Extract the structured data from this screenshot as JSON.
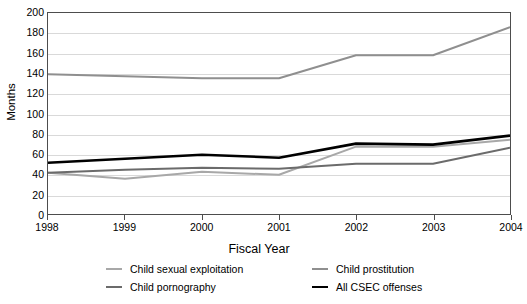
{
  "chart_data": {
    "type": "line",
    "title": "",
    "xlabel": "Fiscal Year",
    "ylabel": "Months",
    "x": [
      1998,
      1999,
      2000,
      2001,
      2002,
      2003,
      2004
    ],
    "categories": [
      "1998",
      "1999",
      "2000",
      "2001",
      "2002",
      "2003",
      "2004"
    ],
    "ylim": [
      0,
      200
    ],
    "yticks": [
      0,
      20,
      40,
      60,
      80,
      100,
      120,
      140,
      160,
      180,
      200
    ],
    "ytick_labels": [
      "0",
      "20",
      "40",
      "60",
      "80",
      "100",
      "120",
      "140",
      "160",
      "180",
      "200"
    ],
    "grid": true,
    "legend_position": "bottom",
    "series": [
      {
        "name": "Child sexual exploitation",
        "color": "#a8a8a8",
        "width": 2,
        "values": [
          41,
          35,
          42,
          39,
          67,
          67,
          74
        ]
      },
      {
        "name": "Child pornography",
        "color": "#6b6b6b",
        "width": 2,
        "values": [
          41,
          44,
          46,
          45,
          50,
          50,
          66
        ]
      },
      {
        "name": "Child prostitution",
        "color": "#8f8f8f",
        "width": 2,
        "values": [
          139,
          137,
          135,
          135,
          158,
          158,
          186
        ]
      },
      {
        "name": "All CSEC offenses",
        "color": "#000000",
        "width": 2.6,
        "values": [
          51,
          55,
          59,
          56,
          70,
          69,
          78
        ]
      }
    ]
  },
  "footnote": {
    "text": ""
  }
}
